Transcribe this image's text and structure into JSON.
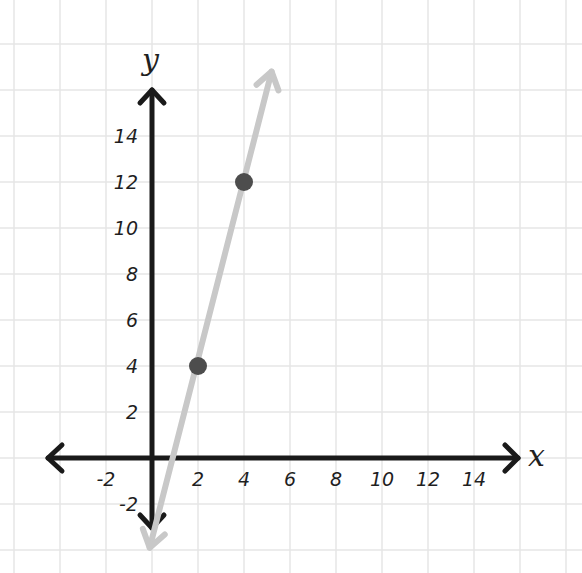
{
  "chart_data": {
    "type": "line",
    "title": "",
    "xlabel": "x",
    "ylabel": "y",
    "xlim": [
      -4,
      16
    ],
    "ylim": [
      -4,
      18
    ],
    "grid": true,
    "x_ticks": [
      -2,
      2,
      4,
      6,
      8,
      10,
      12,
      14
    ],
    "y_ticks": [
      -2,
      2,
      4,
      6,
      8,
      10,
      12,
      14
    ],
    "series": [
      {
        "name": "line",
        "kind": "line-with-arrows",
        "color": "#c8c8c8",
        "equation": "y = 4x - 4",
        "x": [
          -0.1,
          5.2
        ],
        "y": [
          -3.9,
          16.8
        ]
      },
      {
        "name": "points",
        "kind": "scatter",
        "color": "#4d4d4d",
        "x": [
          2,
          4
        ],
        "y": [
          4,
          12
        ]
      }
    ]
  },
  "layout": {
    "origin_px": [
      152,
      458
    ],
    "unit_px": 23,
    "colors": {
      "axis": "#1a1a1a",
      "grid": "#e6e6e6",
      "line": "#c8c8c8",
      "point": "#4d4d4d"
    }
  }
}
